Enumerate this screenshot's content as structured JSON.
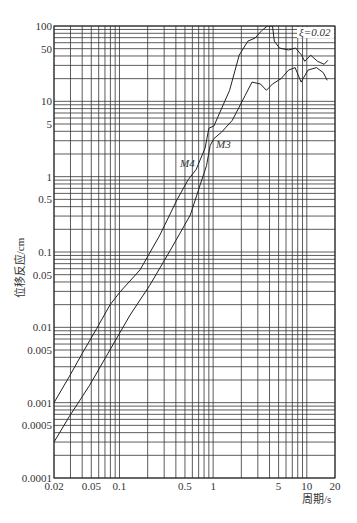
{
  "chart_data": {
    "type": "line",
    "title": "",
    "xlabel": "周期/s",
    "ylabel": "位移反应/cm",
    "xscale": "log",
    "yscale": "log",
    "xlim": [
      0.02,
      20
    ],
    "ylim": [
      0.0001,
      100
    ],
    "x_ticks": [
      "0.02",
      "0.05",
      "0.1",
      "0.5",
      "1",
      "5",
      "10",
      "20"
    ],
    "x_tick_values": [
      0.02,
      0.05,
      0.1,
      0.5,
      1,
      5,
      10,
      20
    ],
    "y_ticks": [
      "100",
      "50",
      "10",
      "5",
      "1",
      "0.5",
      "0.1",
      "0.05",
      "0.01",
      "0.005",
      "0.001",
      "0.0005",
      "0.0001"
    ],
    "y_tick_values": [
      100,
      50,
      10,
      5,
      1,
      0.5,
      0.1,
      0.05,
      0.01,
      0.005,
      0.001,
      0.0005,
      0.0001
    ],
    "grid": true,
    "annotations": [
      {
        "text": "ξ=0.02",
        "x": 14,
        "y": 85
      },
      {
        "text": "M4",
        "x": 0.52,
        "y": 1.3
      },
      {
        "text": "M3",
        "x": 1.05,
        "y": 2.3
      }
    ],
    "series": [
      {
        "name": "M4",
        "x": [
          0.02,
          0.029,
          0.04,
          0.057,
          0.079,
          0.101,
          0.166,
          0.27,
          0.41,
          0.54,
          0.66,
          0.82,
          0.9,
          1.02,
          1.5,
          1.9,
          2.35,
          2.8,
          3.3,
          3.8,
          4.3,
          4.5,
          5.1,
          6.4,
          7.6,
          8.8,
          9.5,
          11,
          13,
          15.3,
          16.8
        ],
        "y": [
          0.001,
          0.0022,
          0.0045,
          0.0096,
          0.0198,
          0.0294,
          0.058,
          0.168,
          0.49,
          0.91,
          1.25,
          2.4,
          4.4,
          4.7,
          14,
          41,
          63,
          69,
          87,
          100,
          100,
          63,
          51,
          48,
          51,
          41,
          34,
          41,
          34,
          31,
          35
        ]
      },
      {
        "name": "M3",
        "x": [
          0.02,
          0.029,
          0.048,
          0.079,
          0.13,
          0.21,
          0.35,
          0.57,
          0.73,
          0.85,
          0.93,
          1.02,
          1.23,
          1.6,
          2.2,
          2.6,
          3.2,
          3.7,
          4.3,
          5.3,
          6.4,
          7.5,
          8.7,
          10.3,
          12.7,
          15,
          16.5
        ],
        "y": [
          0.0003,
          0.00065,
          0.0017,
          0.005,
          0.0146,
          0.036,
          0.106,
          0.31,
          0.79,
          1.4,
          2.6,
          3.2,
          3.9,
          5.6,
          12,
          18,
          17,
          14,
          17,
          20,
          26,
          28,
          18,
          26,
          28,
          24,
          19
        ]
      }
    ],
    "legend": "none"
  },
  "plot": {
    "left": 54,
    "right": 335,
    "top": 26,
    "bottom": 478,
    "line_color": "#222222",
    "grid_color": "#333333",
    "bg_color": "#ffffff"
  },
  "labels": {
    "damping": "ξ=0.02",
    "m4": "M4",
    "m3": "M3",
    "xlabel": "周期/s",
    "ylabel": "位移反应/cm"
  }
}
